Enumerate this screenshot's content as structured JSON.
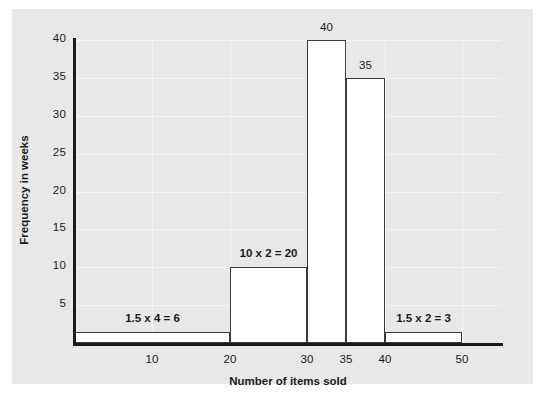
{
  "chart_data": {
    "type": "bar",
    "title": "",
    "subtitle": "",
    "xlabel": "Number of items sold",
    "ylabel": "Frequency in weeks",
    "xlim": [
      0,
      55
    ],
    "ylim": [
      0,
      40
    ],
    "xticks": [
      "10",
      "20",
      "30",
      "35",
      "40",
      "50"
    ],
    "xtick_values": [
      10,
      20,
      30,
      35,
      40,
      50
    ],
    "yticks": [
      "5",
      "10",
      "15",
      "20",
      "25",
      "30",
      "35",
      "40"
    ],
    "ytick_values": [
      5,
      10,
      15,
      20,
      25,
      30,
      35,
      40
    ],
    "grid": true,
    "legend": "none",
    "note": "Histogram with unequal class widths; bar heights are frequency densities, areas give the frequencies shown in the annotations.",
    "bars": [
      {
        "name": "bin-0-20",
        "x_start": 0,
        "x_end": 20,
        "height": 1.5,
        "frequency": 6,
        "annotation": "1.5 x 4 = 6",
        "top_label": ""
      },
      {
        "name": "bin-20-30",
        "x_start": 20,
        "x_end": 30,
        "height": 10,
        "frequency": 20,
        "annotation": "10 x 2 = 20",
        "top_label": ""
      },
      {
        "name": "bin-30-35",
        "x_start": 30,
        "x_end": 35,
        "height": 40,
        "frequency": 40,
        "annotation": "",
        "top_label": "40"
      },
      {
        "name": "bin-35-40",
        "x_start": 35,
        "x_end": 40,
        "height": 35,
        "frequency": 35,
        "annotation": "",
        "top_label": "35"
      },
      {
        "name": "bin-40-50",
        "x_start": 40,
        "x_end": 50,
        "height": 1.5,
        "frequency": 3,
        "annotation": "1.5 x 2 = 3",
        "top_label": ""
      }
    ],
    "colors": {
      "panel_background": "#e8e8e8",
      "bar_fill": "#ffffff",
      "bar_stroke": "#3a3a3a",
      "axis": "#1a1a1a",
      "gridline": "#f4f4f4",
      "text": "#1a1a1a"
    }
  }
}
